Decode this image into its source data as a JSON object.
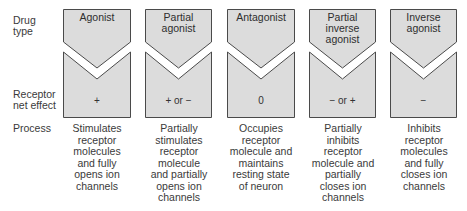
{
  "row_labels": {
    "drug_type": "Drug\ntype",
    "net_effect": "Receptor\nnet effect",
    "process": "Process"
  },
  "colors": {
    "box_fill": "#dcdcdc",
    "box_stroke": "#4a4a4a",
    "text": "#3a3a3a"
  },
  "columns": [
    {
      "drug_type": "Agonist",
      "net_effect": "+",
      "process": "Stimulates\nreceptor\nmolecules\nand fully\nopens ion\nchannels"
    },
    {
      "drug_type": "Partial\nagonist",
      "net_effect": "+ or −",
      "process": "Partially\nstimulates\nreceptor\nmolecule\nand partially\nopens ion\nchannels"
    },
    {
      "drug_type": "Antagonist",
      "net_effect": "0",
      "process": "Occupies\nreceptor\nmolecule and\nmaintains\nresting state\nof neuron"
    },
    {
      "drug_type": "Partial\ninverse\nagonist",
      "net_effect": "− or +",
      "process": "Partially\ninhibits\nreceptor\nmolecule and\npartially\ncloses ion\nchannels"
    },
    {
      "drug_type": "Inverse\nagonist",
      "net_effect": "−",
      "process": "Inhibits\nreceptor\nmolecules\nand fully\ncloses ion\nchannels"
    }
  ]
}
